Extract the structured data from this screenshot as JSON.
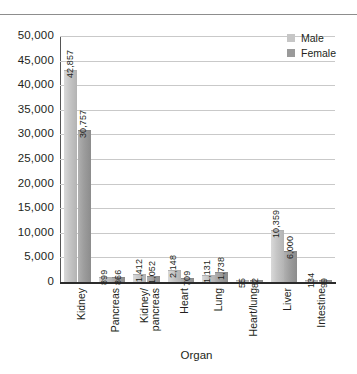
{
  "chart_data": {
    "type": "bar",
    "title": "",
    "xlabel": "Organ",
    "ylabel": "",
    "ylim": [
      0,
      50000
    ],
    "grid": true,
    "legend_position": "top-right",
    "categories": [
      "Kidney",
      "Pancreas",
      "Kidney/pancreas",
      "Heart",
      "Lung",
      "Heart/lung",
      "Liver",
      "Intestine"
    ],
    "category_lines": [
      [
        "Kidney"
      ],
      [
        "Pancreas"
      ],
      [
        "Kidney/",
        "pancreas"
      ],
      [
        "Heart"
      ],
      [
        "Lung"
      ],
      [
        "Heart/lung"
      ],
      [
        "Liver"
      ],
      [
        "Intestine"
      ]
    ],
    "series": [
      {
        "name": "Male",
        "color": "#c6c6c6",
        "values": [
          42857,
          899,
          1412,
          2148,
          1131,
          55,
          10359,
          134
        ],
        "labels": [
          "42,857",
          "899",
          "1,412",
          "2,148",
          "1,131",
          "55",
          "10,359",
          "134"
        ]
      },
      {
        "name": "Female",
        "color": "#9a9a9a",
        "values": [
          30757,
          866,
          1052,
          709,
          1738,
          82,
          6000,
          99
        ],
        "labels": [
          "30,757",
          "866",
          "1,052",
          "709",
          "1,738",
          "82",
          "6,000",
          "99"
        ]
      }
    ],
    "yticks": [
      0,
      5000,
      10000,
      15000,
      20000,
      25000,
      30000,
      35000,
      40000,
      45000,
      50000
    ],
    "ytick_labels": [
      "0",
      "5,000",
      "10,000",
      "15,000",
      "20,000",
      "25,000",
      "30,000",
      "35,000",
      "40,000",
      "45,000",
      "50,000"
    ]
  }
}
